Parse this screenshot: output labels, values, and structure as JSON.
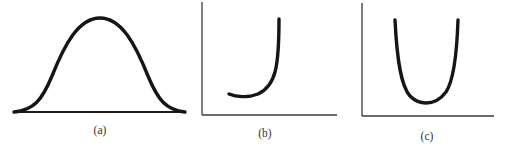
{
  "figure": {
    "panels": [
      {
        "id": "a",
        "caption": "(a)",
        "shape": "bell-shaped curve",
        "has_axes": false
      },
      {
        "id": "b",
        "caption": "(b)",
        "shape": "J-shaped curve",
        "has_axes": true
      },
      {
        "id": "c",
        "caption": "(c)",
        "shape": "U-shaped curve",
        "has_axes": true
      }
    ]
  },
  "colors": {
    "curve": "#151515",
    "axis": "#3a3a3a",
    "background": "#ffffff"
  }
}
